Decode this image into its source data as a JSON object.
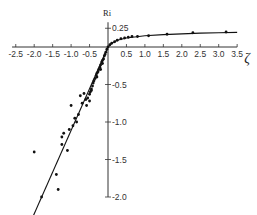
{
  "chart_data": {
    "type": "scatter",
    "title": "",
    "xlabel": "ζ",
    "ylabel": "Ri",
    "xlim": [
      -2.5,
      3.5
    ],
    "ylim": [
      -2.0,
      0.25
    ],
    "grid": false,
    "legend": null,
    "x_ticks": [
      "-2.5",
      "-2.0",
      "-1.5",
      "-1.0",
      "-0.5",
      "0.5",
      "1.0",
      "1.5",
      "2.0",
      "2.5",
      "3.0",
      "3.5"
    ],
    "x_tick_values": [
      -2.5,
      -2.0,
      -1.5,
      -1.0,
      -0.5,
      0.5,
      1.0,
      1.5,
      2.0,
      2.5,
      3.0,
      3.5
    ],
    "y_ticks": [
      "0.25",
      "-0.5",
      "-1.0",
      "-1.5",
      "-2.0"
    ],
    "y_tick_values": [
      0.25,
      -0.5,
      -1.0,
      -1.5,
      -2.0
    ],
    "series": [
      {
        "name": "observations",
        "kind": "points",
        "points": [
          [
            3.2,
            0.2
          ],
          [
            2.3,
            0.19
          ],
          [
            1.6,
            0.17
          ],
          [
            1.1,
            0.15
          ],
          [
            0.8,
            0.14
          ],
          [
            0.65,
            0.14
          ],
          [
            0.55,
            0.13
          ],
          [
            0.45,
            0.12
          ],
          [
            0.35,
            0.11
          ],
          [
            0.25,
            0.09
          ],
          [
            0.18,
            0.07
          ],
          [
            0.1,
            0.05
          ],
          [
            0.05,
            0.03
          ],
          [
            0.0,
            0.0
          ],
          [
            -0.03,
            -0.03
          ],
          [
            -0.06,
            -0.07
          ],
          [
            -0.08,
            -0.1
          ],
          [
            -0.1,
            -0.12
          ],
          [
            -0.12,
            -0.16
          ],
          [
            -0.15,
            -0.18
          ],
          [
            -0.17,
            -0.2
          ],
          [
            -0.2,
            -0.24
          ],
          [
            -0.22,
            -0.27
          ],
          [
            -0.25,
            -0.3
          ],
          [
            -0.27,
            -0.33
          ],
          [
            -0.3,
            -0.35
          ],
          [
            -0.32,
            -0.38
          ],
          [
            -0.35,
            -0.42
          ],
          [
            -0.38,
            -0.45
          ],
          [
            -0.4,
            -0.48
          ],
          [
            -0.42,
            -0.52
          ],
          [
            -0.45,
            -0.56
          ],
          [
            -0.48,
            -0.6
          ],
          [
            -0.5,
            -0.63
          ],
          [
            -0.55,
            -0.68
          ],
          [
            -0.6,
            -0.7
          ],
          [
            -0.65,
            -0.62
          ],
          [
            -0.7,
            -0.75
          ],
          [
            -0.75,
            -0.65
          ],
          [
            -0.8,
            -0.9
          ],
          [
            -0.85,
            -1.0
          ],
          [
            -0.9,
            -0.95
          ],
          [
            -0.95,
            -1.05
          ],
          [
            -1.0,
            -0.78
          ],
          [
            -1.05,
            -1.1
          ],
          [
            -1.2,
            -1.15
          ],
          [
            -1.25,
            -1.2
          ],
          [
            -1.25,
            -1.3
          ],
          [
            -1.1,
            -1.38
          ],
          [
            -2.0,
            -1.4
          ],
          [
            -1.4,
            -1.7
          ],
          [
            -1.35,
            -1.9
          ],
          [
            -1.8,
            -2.0
          ],
          [
            -0.45,
            -0.58
          ],
          [
            -0.3,
            -0.4
          ],
          [
            -0.2,
            -0.3
          ],
          [
            -0.15,
            -0.22
          ],
          [
            -0.5,
            -0.72
          ],
          [
            -0.58,
            -0.78
          ]
        ]
      },
      {
        "name": "fit-stable",
        "kind": "curve",
        "points": [
          [
            0.0,
            0.0
          ],
          [
            0.1,
            0.05
          ],
          [
            0.25,
            0.09
          ],
          [
            0.5,
            0.12
          ],
          [
            1.0,
            0.15
          ],
          [
            1.5,
            0.165
          ],
          [
            2.0,
            0.175
          ],
          [
            2.5,
            0.185
          ],
          [
            3.0,
            0.19
          ],
          [
            3.5,
            0.195
          ]
        ]
      },
      {
        "name": "fit-unstable",
        "kind": "line",
        "points": [
          [
            0.0,
            0.0
          ],
          [
            -2.05,
            -2.28
          ]
        ]
      }
    ]
  }
}
